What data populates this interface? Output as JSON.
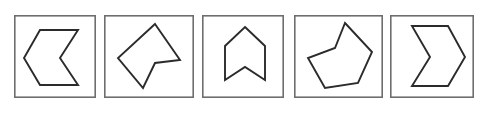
{
  "canvas": {
    "width": 477,
    "height": 115,
    "background_color": "#ffffff"
  },
  "style": {
    "frame_stroke_color": "#6e6e6e",
    "frame_fill_color": "#ffffff",
    "shape_stroke_color": "#2b2b2b",
    "shape_fill_color": "#ffffff",
    "frame_stroke_width": 1.6,
    "shape_stroke_width": 1.9
  },
  "strip": {
    "kind": "shape-comparison-strip",
    "panel_count": 5,
    "panels": [
      {
        "index": 1,
        "name": "panel-1",
        "shape_name": "left-pointing-chevron",
        "shape_description": "Left-pointing chevron arrow: concave hexagon with notch on the right side",
        "vertex_count": 6,
        "concave": true,
        "frame": {
          "x": 14,
          "y": 15,
          "width": 82,
          "height": 83
        },
        "viewbox": "0 0 82 83",
        "points": "64,15 26,15 10,43 26,70 64,70 46,43"
      },
      {
        "index": 2,
        "name": "panel-2",
        "shape_description": "Irregular concave pentagon tilted with a reflex vertex on the right",
        "shape_name": "irregular-concave-pentagon",
        "vertex_count": 5,
        "concave": true,
        "frame": {
          "x": 104,
          "y": 15,
          "width": 90,
          "height": 83
        },
        "viewbox": "0 0 90 83",
        "points": "51,9 76,45 51,48 39,73 14,43"
      },
      {
        "index": 3,
        "name": "panel-3",
        "shape_description": "Upward chevron banner: house-like pentagon with a V-notch cut into the bottom edge",
        "shape_name": "up-chevron-banner",
        "vertex_count": 6,
        "concave": true,
        "frame": {
          "x": 202,
          "y": 15,
          "width": 82,
          "height": 83
        },
        "viewbox": "0 0 82 83",
        "points": "43,12 63,31 63,65 43,52 23,65 23,31"
      },
      {
        "index": 4,
        "name": "panel-4",
        "shape_description": "Irregular concave hexagon leaning right with a reflex notch on the upper left",
        "shape_name": "irregular-concave-hexagon",
        "vertex_count": 6,
        "concave": true,
        "frame": {
          "x": 294,
          "y": 15,
          "width": 89,
          "height": 83
        },
        "viewbox": "0 0 89 83",
        "points": "51,8 78,37 64,68 31,73 14,43 41,33"
      },
      {
        "index": 5,
        "name": "panel-5",
        "shape_description": "Right-pointing chevron arrow: concave hexagon with notch on the left side",
        "shape_name": "right-pointing-chevron",
        "vertex_count": 6,
        "concave": true,
        "frame": {
          "x": 390,
          "y": 15,
          "width": 84,
          "height": 83
        },
        "viewbox": "0 0 84 83",
        "points": "22,11 58,11 75,42 58,71 22,71 40,42"
      }
    ]
  }
}
